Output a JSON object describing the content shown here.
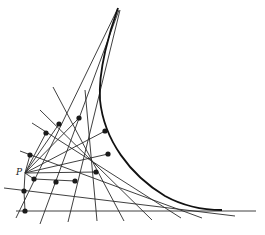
{
  "figure": {
    "point_label": "P",
    "point": [
      25,
      173
    ],
    "colors": {
      "line": "#2a2a2a",
      "curve": "#111111",
      "dot": "#1a1a1a"
    },
    "envelope_path": "M118,8 C110,30 98,70 100,100 C104,140 130,175 165,196 C185,207 205,210 222,210",
    "tangent_lines": [
      [
        [
          16,
          218
        ],
        [
          118,
          8
        ]
      ],
      [
        [
          40,
          224
        ],
        [
          119,
          10
        ]
      ],
      [
        [
          68,
          222
        ],
        [
          120,
          10
        ]
      ],
      [
        [
          97,
          221
        ],
        [
          85,
          90
        ]
      ],
      [
        [
          124,
          221
        ],
        [
          53,
          87
        ]
      ],
      [
        [
          152,
          220
        ],
        [
          40,
          110
        ]
      ],
      [
        [
          181,
          218
        ],
        [
          32,
          123
        ]
      ],
      [
        [
          202,
          218
        ],
        [
          20,
          151
        ]
      ],
      [
        [
          235,
          216
        ],
        [
          4,
          188
        ]
      ],
      [
        [
          256,
          211
        ],
        [
          16,
          211
        ]
      ],
      [
        [
          25,
          173
        ],
        [
          96,
          172
        ]
      ],
      [
        [
          25,
          173
        ],
        [
          108,
          154
        ]
      ],
      [
        [
          25,
          173
        ],
        [
          105,
          131
        ]
      ],
      [
        [
          25,
          173
        ],
        [
          79,
          118
        ]
      ],
      [
        [
          25,
          173
        ],
        [
          59,
          124
        ]
      ],
      [
        [
          25,
          173
        ],
        [
          46,
          133
        ]
      ],
      [
        [
          25,
          173
        ],
        [
          30,
          155
        ]
      ],
      [
        [
          25,
          173
        ],
        [
          34,
          179
        ]
      ],
      [
        [
          34,
          179
        ],
        [
          75,
          181
        ]
      ],
      [
        [
          25,
          173
        ],
        [
          24,
          191
        ]
      ],
      [
        [
          24,
          191
        ],
        [
          25,
          211
        ]
      ]
    ],
    "foot_points": [
      [
        24,
        191
      ],
      [
        25,
        211
      ],
      [
        34,
        179
      ],
      [
        56,
        182
      ],
      [
        75,
        181
      ],
      [
        96,
        172
      ],
      [
        30,
        155
      ],
      [
        46,
        133
      ],
      [
        59,
        124
      ],
      [
        79,
        118
      ],
      [
        105,
        131
      ],
      [
        108,
        154
      ]
    ]
  }
}
